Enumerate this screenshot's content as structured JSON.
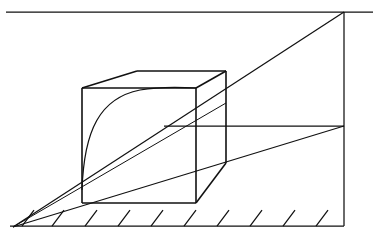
{
  "figure": {
    "canvas": {
      "width": 373,
      "height": 237
    },
    "colors": {
      "background": "#ffffff",
      "ink": "#111111"
    },
    "geometry": {
      "horizon_line": {
        "name": "horizon-line",
        "x1": 6,
        "y1": 12,
        "x2": 373,
        "y2": 12
      },
      "ground_line": {
        "name": "ground-line",
        "x1": 10,
        "y1": 226,
        "x2": 344,
        "y2": 226
      },
      "vertical_right_edge": {
        "name": "right-vertical-edge",
        "x1": 344,
        "y1": 12,
        "x2": 344,
        "y2": 226
      },
      "vanishing_point_left": {
        "name": "vanishing-point-left",
        "x": 13,
        "y": 227
      },
      "measuring_line": {
        "name": "measuring-line",
        "x1": 164,
        "y1": 126,
        "x2": 344,
        "y2": 126
      },
      "rays_from_vp": [
        {
          "name": "ray-to-top-right",
          "x1": 13,
          "y1": 227,
          "x2": 344,
          "y2": 12
        },
        {
          "name": "ray-to-mid-right",
          "x1": 13,
          "y1": 227,
          "x2": 344,
          "y2": 126
        },
        {
          "name": "ray-through-cube",
          "x1": 13,
          "y1": 227,
          "x2": 226,
          "y2": 103
        }
      ],
      "cube": {
        "front_face": {
          "name": "cube-front-face",
          "top_left": {
            "x": 82,
            "y": 88
          },
          "top_right": {
            "x": 196,
            "y": 88
          },
          "bottom_right": {
            "x": 196,
            "y": 203
          },
          "bottom_left": {
            "x": 82,
            "y": 203
          }
        },
        "back_top_left": {
          "x": 137,
          "y": 71
        },
        "back_top_right": {
          "x": 226,
          "y": 71
        },
        "back_bottom_right": {
          "x": 226,
          "y": 163
        },
        "edges": [
          "front-top",
          "front-right",
          "front-bottom",
          "front-left",
          "top-left-receding",
          "top-right-receding",
          "top-back",
          "back-right-vertical",
          "bottom-right-receding"
        ]
      },
      "inscribed_curve": {
        "name": "inscribed-curve",
        "start": {
          "x": 82,
          "y": 178
        },
        "end": {
          "x": 196,
          "y": 88
        },
        "control_1": {
          "x": 96,
          "y": 108
        },
        "control_2": {
          "x": 140,
          "y": 88
        }
      },
      "ground_hatching": {
        "name": "ground-hatch-marks",
        "count": 10,
        "angle_deg": 52,
        "length": 20,
        "x_positions": [
          22,
          52,
          85,
          118,
          151,
          184,
          217,
          250,
          283,
          316
        ]
      }
    }
  }
}
